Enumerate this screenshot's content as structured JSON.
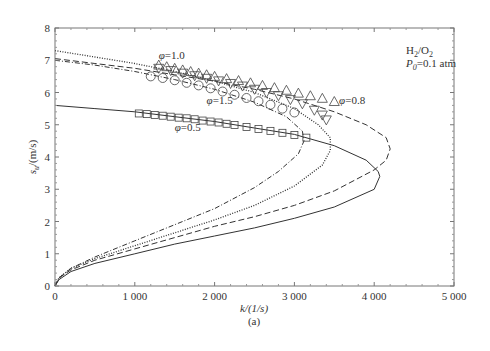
{
  "chart_data": {
    "type": "line",
    "title": "",
    "subtitle": "(a)",
    "xlabel": "k/(1/s)",
    "ylabel": "s_u/(m/s)",
    "xlim": [
      0,
      5000
    ],
    "ylim": [
      0,
      8
    ],
    "x_ticks": [
      0,
      1000,
      2000,
      3000,
      4000,
      5000
    ],
    "x_tick_labels": [
      "0",
      "1 000",
      "2 000",
      "3 000",
      "4 000",
      "5 000"
    ],
    "y_ticks": [
      0,
      1,
      2,
      3,
      4,
      5,
      6,
      7,
      8
    ],
    "y_tick_labels": [
      "0",
      "1",
      "2",
      "3",
      "4",
      "5",
      "6",
      "7",
      "8"
    ],
    "grid": false,
    "annotations": [
      {
        "text": "H2/O2",
        "x": 4400,
        "y": 7.2
      },
      {
        "text": "P0=0.1 atm",
        "x": 4400,
        "y": 6.8
      },
      {
        "text": "φ=1.0",
        "x": 1300,
        "y": 7.05
      },
      {
        "text": "φ=1.5",
        "x": 1900,
        "y": 5.65
      },
      {
        "text": "φ=0.8",
        "x": 3560,
        "y": 5.65
      },
      {
        "text": "φ=0.5",
        "x": 1500,
        "y": 4.8
      }
    ],
    "series": [
      {
        "name": "φ=0.5 (model)",
        "style": "solid",
        "x": [
          0,
          500,
          1000,
          1500,
          2000,
          2500,
          3000,
          3500,
          3900,
          4050,
          4070,
          4000,
          3500,
          3000,
          2500,
          2000,
          1500,
          1000,
          500,
          200,
          50,
          0
        ],
        "y": [
          5.6,
          5.5,
          5.4,
          5.25,
          5.1,
          4.9,
          4.7,
          4.35,
          3.9,
          3.55,
          3.4,
          3.0,
          2.45,
          2.1,
          1.8,
          1.55,
          1.3,
          1.0,
          0.7,
          0.45,
          0.2,
          0
        ]
      },
      {
        "name": "φ=0.8 (model)",
        "style": "dashed",
        "x": [
          0,
          500,
          1000,
          1500,
          2000,
          2500,
          3000,
          3500,
          3900,
          4150,
          4200,
          4150,
          4000,
          3500,
          3000,
          2500,
          2000,
          1500,
          1000,
          500,
          200,
          50,
          0
        ],
        "y": [
          7.05,
          6.9,
          6.75,
          6.55,
          6.35,
          6.1,
          5.8,
          5.4,
          5.0,
          4.6,
          4.25,
          3.9,
          3.6,
          2.95,
          2.5,
          2.15,
          1.85,
          1.5,
          1.15,
          0.8,
          0.5,
          0.25,
          0
        ]
      },
      {
        "name": "φ=1.0 (model)",
        "style": "dotted",
        "x": [
          0,
          500,
          1000,
          1500,
          2000,
          2500,
          3000,
          3300,
          3450,
          3450,
          3350,
          3000,
          2500,
          2000,
          1500,
          1000,
          500,
          200,
          50,
          0
        ],
        "y": [
          7.3,
          7.1,
          6.9,
          6.65,
          6.35,
          6.0,
          5.5,
          5.0,
          4.6,
          4.2,
          3.75,
          3.1,
          2.5,
          2.05,
          1.65,
          1.25,
          0.85,
          0.55,
          0.25,
          0
        ]
      },
      {
        "name": "φ=1.5 (model)",
        "style": "dash-dot",
        "x": [
          0,
          500,
          1000,
          1500,
          2000,
          2500,
          2900,
          3100,
          3120,
          3050,
          2800,
          2500,
          2000,
          1500,
          1000,
          500,
          200,
          50,
          0
        ],
        "y": [
          7.0,
          6.85,
          6.65,
          6.4,
          6.1,
          5.7,
          5.25,
          4.8,
          4.5,
          4.1,
          3.55,
          3.05,
          2.4,
          1.9,
          1.4,
          0.9,
          0.55,
          0.25,
          0
        ]
      },
      {
        "name": "φ=0.5 (data)",
        "marker": "square",
        "x": [
          1050,
          1150,
          1250,
          1350,
          1450,
          1550,
          1650,
          1750,
          1850,
          1950,
          2050,
          2150,
          2250,
          2400,
          2550,
          2700,
          2850,
          3000,
          3150
        ],
        "y": [
          5.35,
          5.33,
          5.3,
          5.28,
          5.25,
          5.22,
          5.2,
          5.17,
          5.13,
          5.1,
          5.07,
          5.03,
          4.99,
          4.93,
          4.87,
          4.81,
          4.75,
          4.68,
          4.6
        ]
      },
      {
        "name": "φ=0.8 (data)",
        "marker": "triangle-up",
        "x": [
          1300,
          1400,
          1500,
          1600,
          1700,
          1800,
          1900,
          2000,
          2150,
          2300,
          2450,
          2600,
          2750,
          2900,
          3050,
          3200,
          3350,
          3500
        ],
        "y": [
          6.85,
          6.8,
          6.75,
          6.7,
          6.65,
          6.6,
          6.55,
          6.5,
          6.43,
          6.37,
          6.3,
          6.22,
          6.15,
          6.07,
          5.98,
          5.9,
          5.82,
          5.72
        ]
      },
      {
        "name": "φ=1.0 (data)",
        "marker": "triangle-down",
        "x": [
          1300,
          1450,
          1600,
          1750,
          1900,
          2050,
          2200,
          2350,
          2500,
          2650,
          2800,
          2950,
          3100,
          3250,
          3350,
          3400
        ],
        "y": [
          6.75,
          6.68,
          6.6,
          6.52,
          6.44,
          6.36,
          6.28,
          6.2,
          6.1,
          6.0,
          5.9,
          5.78,
          5.65,
          5.45,
          5.3,
          5.15
        ]
      },
      {
        "name": "φ=1.5 (data)",
        "marker": "circle",
        "x": [
          1200,
          1350,
          1500,
          1650,
          1800,
          1950,
          2100,
          2250,
          2400,
          2550,
          2700,
          2850,
          3000
        ],
        "y": [
          6.5,
          6.45,
          6.38,
          6.3,
          6.22,
          6.13,
          6.03,
          5.93,
          5.83,
          5.73,
          5.62,
          5.5,
          5.38
        ]
      }
    ]
  }
}
